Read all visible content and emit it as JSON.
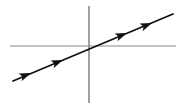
{
  "figure": {
    "title": "Graph of a straight line through the origin on a pair of coordinate axes",
    "width": 183,
    "height": 108,
    "background_color": "#ffffff"
  },
  "chart_data": {
    "type": "line",
    "title": "",
    "subtitle": "",
    "xlabel": "",
    "ylabel": "",
    "grid": false,
    "legend": false,
    "legend_position": "none",
    "tick_labels": {
      "x": [],
      "y": []
    },
    "annotations": [],
    "axes": {
      "origin_px": {
        "x": 89,
        "y": 46
      },
      "x_axis": {
        "name": "x-axis",
        "orientation": "horizontal",
        "start_px": {
          "x": 10,
          "y": 46
        },
        "end_px": {
          "x": 176,
          "y": 46
        },
        "color": "#8a8a8a",
        "stroke_width": 1.2,
        "arrowheads": "none"
      },
      "y_axis": {
        "name": "y-axis",
        "orientation": "vertical",
        "start_px": {
          "x": 89,
          "y": 6
        },
        "end_px": {
          "x": 89,
          "y": 103
        },
        "color": "#8a8a8a",
        "stroke_width": 1.6,
        "arrowheads": "none"
      }
    },
    "series": [
      {
        "name": "line-through-origin",
        "color": "#111111",
        "stroke_width": 1.8,
        "passes_through_origin": true,
        "slope_sign": "positive",
        "slope_screen": -0.415,
        "start_px": {
          "x": 13,
          "y": 81
        },
        "end_px": {
          "x": 173,
          "y": 14
        },
        "direction_markers": [
          {
            "index": 0,
            "name": "arrowhead-lower-left-outer",
            "x": 31,
            "y": 73,
            "points": "up-right"
          },
          {
            "index": 1,
            "name": "arrowhead-lower-left-inner",
            "x": 63,
            "y": 60,
            "points": "up-right"
          },
          {
            "index": 2,
            "name": "arrowhead-upper-right-inner",
            "x": 127,
            "y": 33,
            "points": "up-right"
          },
          {
            "index": 3,
            "name": "arrowhead-upper-right-outer",
            "x": 152,
            "y": 23,
            "points": "up-right"
          }
        ]
      }
    ]
  }
}
